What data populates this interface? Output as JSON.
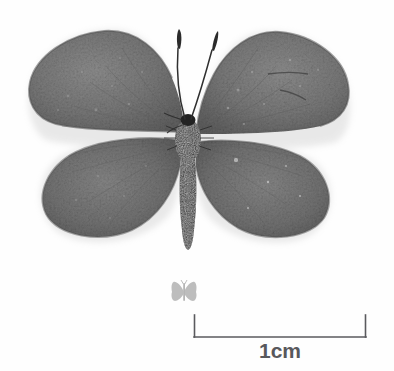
{
  "plate": {
    "title": "Butterfly specimen photograph with scale bar",
    "background_color": "#fefefe",
    "width": 394,
    "height": 371
  },
  "specimen": {
    "name": "pinned butterfly specimen",
    "view": "dorsal, wings spread",
    "colors": {
      "wing_fill": "#737373",
      "wing_fill_light": "#8a8a8a",
      "wing_fill_dark": "#5e5e5e",
      "wing_edge": "#9a9a9a",
      "body": "#262626",
      "antenna": "#333333",
      "halo": "#e8e8e8"
    },
    "parts": [
      "left-forewing",
      "right-forewing",
      "left-hindwing",
      "right-hindwing",
      "thorax",
      "abdomen",
      "left-antenna",
      "right-antenna",
      "head"
    ]
  },
  "scale_icon": {
    "name": "butterfly-silhouette-icon",
    "color": "#a8a8a8",
    "caption": ""
  },
  "scale_bar": {
    "label": "1cm",
    "color": "#5a5a5e",
    "length_px": 172,
    "tick_height_px": 22,
    "left_x": 194,
    "right_x": 366,
    "baseline_y": 337
  }
}
